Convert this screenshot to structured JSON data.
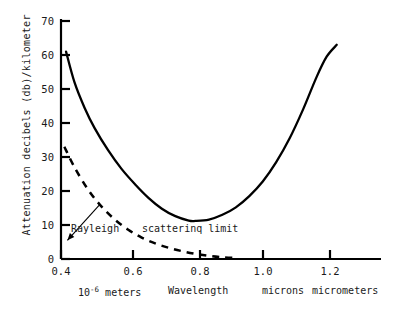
{
  "chart_data": {
    "type": "line",
    "title": "",
    "subtitle": "",
    "xlabel": "Wavelength",
    "ylabel": "Attenuation  decibels  (db)/kilometer",
    "xlim": [
      0.4,
      1.35
    ],
    "ylim": [
      0,
      72
    ],
    "grid": false,
    "legend_position": "inline-annotations",
    "x_ticks": [
      "0.4",
      "0.6",
      "0.8",
      "1.0",
      "1.2"
    ],
    "x_tick_values": [
      0.4,
      0.6,
      0.8,
      1.0,
      1.2
    ],
    "y_ticks": [
      "0",
      "10",
      "20",
      "30",
      "40",
      "50",
      "60",
      "70"
    ],
    "y_tick_values": [
      0,
      10,
      20,
      30,
      40,
      50,
      60,
      70
    ],
    "series": [
      {
        "name": "Total attenuation",
        "style": "solid",
        "color": "#000000",
        "x": [
          0.415,
          0.44,
          0.47,
          0.5,
          0.54,
          0.58,
          0.62,
          0.66,
          0.7,
          0.74,
          0.78,
          0.8,
          0.84,
          0.88,
          0.92,
          0.96,
          1.0,
          1.04,
          1.08,
          1.12,
          1.16,
          1.19,
          1.22
        ],
        "y": [
          61.0,
          52.0,
          44.5,
          38.5,
          32.0,
          26.5,
          22.0,
          18.0,
          14.8,
          12.6,
          11.3,
          11.2,
          11.6,
          13.0,
          15.2,
          18.5,
          22.8,
          28.5,
          35.5,
          44.0,
          53.5,
          59.5,
          63.0
        ]
      },
      {
        "name": "Rayleigh scattering limit",
        "style": "dashed",
        "color": "#000000",
        "x": [
          0.41,
          0.44,
          0.48,
          0.52,
          0.56,
          0.6,
          0.64,
          0.68,
          0.72,
          0.76,
          0.8,
          0.84,
          0.88,
          0.92
        ],
        "y": [
          33.0,
          27.0,
          20.5,
          15.5,
          11.6,
          8.6,
          6.3,
          4.6,
          3.3,
          2.3,
          1.5,
          0.9,
          0.5,
          0.3
        ]
      }
    ],
    "annotations": [
      {
        "text": "Rayleigh",
        "x": 0.425,
        "y": 5.5,
        "leader_to_x": 0.515,
        "leader_to_y": 16.0
      },
      {
        "text": "scatterinq limit",
        "x": 0.625,
        "y": 5.5
      }
    ],
    "footer_labels": [
      {
        "text": "10",
        "sup": "-6",
        "rest": " meters"
      },
      {
        "text": "Wavelength"
      },
      {
        "text": "microns"
      },
      {
        "text": "micrometers"
      }
    ]
  },
  "axis": {
    "y_title": "Attenuation  decibels  (db)/kilometer",
    "y_tick_labels": [
      "70",
      "60",
      "50",
      "40",
      "30",
      "20",
      "10",
      "0"
    ],
    "x_tick_labels": [
      "0.4",
      "0.6",
      "0.8",
      "1.0",
      "1.2"
    ]
  },
  "footer": {
    "meters_prefix": "10",
    "meters_exponent": "-6",
    "meters_suffix": "meters",
    "wavelength": "Wavelength",
    "microns": "microns",
    "micrometers": "micrometers"
  },
  "annotations": {
    "rayleigh": "Rayleigh",
    "scattering_limit": "scatterinq limit"
  }
}
